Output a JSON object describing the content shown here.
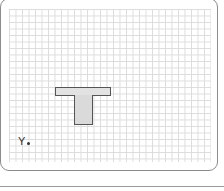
{
  "canvas": {
    "grid": {
      "cell_size_px": 6.5,
      "line_color": "#dcdcdc"
    },
    "shape": {
      "type": "T-shape",
      "fill_color": "#e0e0e0",
      "stroke_color": "#555555"
    },
    "axis_label": {
      "text": "Y",
      "marker": "dot"
    }
  },
  "colors": {
    "panel_border": "#8c8c8c",
    "background": "#ffffff"
  }
}
